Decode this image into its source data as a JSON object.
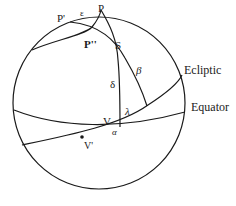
{
  "diagram": {
    "labels": {
      "p_prime": "P'",
      "epsilon": "ε",
      "p": "P",
      "p_double_prime": "P''",
      "s": "S",
      "beta": "β",
      "delta": "δ",
      "lambda": "λ",
      "v": "V",
      "alpha": "α",
      "v_prime": "V'",
      "ecliptic": "Ecliptic",
      "equator": "Equator"
    },
    "colors": {
      "stroke": "#1a1a1a",
      "background": "#ffffff"
    }
  }
}
